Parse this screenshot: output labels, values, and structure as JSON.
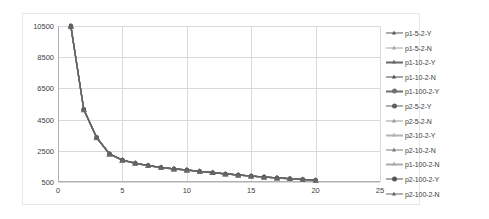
{
  "chart_data": {
    "type": "line",
    "title": "",
    "subtitle": "",
    "xlabel": "",
    "ylabel": "",
    "xlim": [
      0,
      25
    ],
    "ylim": [
      500,
      10500
    ],
    "grid": true,
    "legend_position": "right",
    "x_ticks": [
      "0",
      "5",
      "10",
      "15",
      "20",
      "25"
    ],
    "x_tick_values": [
      0,
      5,
      10,
      15,
      20,
      25
    ],
    "y_ticks": [
      "500",
      "2500",
      "4500",
      "6500",
      "8500",
      "10500"
    ],
    "y_tick_values": [
      500,
      2500,
      4500,
      6500,
      8500,
      10500
    ],
    "x": [
      1,
      2,
      3,
      4,
      5,
      6,
      7,
      8,
      9,
      10,
      11,
      12,
      13,
      14,
      15,
      16,
      17,
      18,
      19,
      20
    ],
    "series": [
      {
        "name": "p1-5-2-Y",
        "color": "#595959",
        "marker": "triangle",
        "values": [
          10500,
          5150,
          3350,
          2300,
          1900,
          1700,
          1550,
          1430,
          1340,
          1270,
          1180,
          1100,
          1020,
          950,
          880,
          820,
          760,
          710,
          660,
          610
        ]
      },
      {
        "name": "p1-5-2-N",
        "color": "#a6a6a6",
        "marker": "triangle",
        "values": [
          10450,
          5120,
          3330,
          2290,
          1890,
          1690,
          1540,
          1420,
          1330,
          1260,
          1170,
          1090,
          1015,
          945,
          875,
          815,
          755,
          705,
          655,
          605
        ]
      },
      {
        "name": "p1-10-2-Y",
        "color": "#6b6b6b",
        "marker": "triangle",
        "values": [
          10500,
          5170,
          3360,
          2310,
          1910,
          1710,
          1560,
          1440,
          1345,
          1275,
          1185,
          1105,
          1025,
          955,
          885,
          825,
          765,
          715,
          665,
          615
        ]
      },
      {
        "name": "p1-10-2-N",
        "color": "#4d4d4d",
        "marker": "triangle",
        "values": [
          10480,
          5140,
          3340,
          2295,
          1895,
          1695,
          1545,
          1425,
          1335,
          1265,
          1175,
          1095,
          1018,
          948,
          878,
          818,
          758,
          708,
          658,
          608
        ]
      },
      {
        "name": "p1-100-2-Y",
        "color": "#707070",
        "marker": "circle",
        "values": [
          10500,
          5160,
          3355,
          2305,
          1905,
          1705,
          1555,
          1435,
          1342,
          1272,
          1182,
          1102,
          1022,
          952,
          882,
          822,
          762,
          712,
          662,
          612
        ]
      },
      {
        "name": "p2-5-2-Y",
        "color": "#5e5e5e",
        "marker": "circle",
        "values": [
          10460,
          5130,
          3335,
          2292,
          1892,
          1692,
          1542,
          1422,
          1332,
          1262,
          1172,
          1092,
          1016,
          946,
          876,
          816,
          756,
          706,
          656,
          606
        ]
      },
      {
        "name": "p2-5-2-N",
        "color": "#9a9a9a",
        "marker": "triangle",
        "values": [
          10440,
          5110,
          3325,
          2288,
          1888,
          1688,
          1538,
          1418,
          1328,
          1258,
          1168,
          1088,
          1012,
          942,
          872,
          812,
          752,
          702,
          652,
          602
        ]
      },
      {
        "name": "p2-10-2-Y",
        "color": "#b3b3b3",
        "marker": "triangle",
        "values": [
          10470,
          5145,
          3342,
          2298,
          1898,
          1698,
          1548,
          1428,
          1338,
          1268,
          1178,
          1098,
          1019,
          949,
          879,
          819,
          759,
          709,
          659,
          609
        ]
      },
      {
        "name": "p2-10-2-N",
        "color": "#7d7d7d",
        "marker": "triangle",
        "values": [
          10490,
          5155,
          3348,
          2302,
          1902,
          1702,
          1552,
          1432,
          1341,
          1271,
          1181,
          1101,
          1021,
          951,
          881,
          821,
          761,
          711,
          661,
          611
        ]
      },
      {
        "name": "p1-100-2-N",
        "color": "#acacac",
        "marker": "triangle",
        "values": [
          10455,
          5125,
          3332,
          2291,
          1891,
          1691,
          1541,
          1421,
          1331,
          1261,
          1171,
          1091,
          1014,
          944,
          874,
          814,
          754,
          704,
          654,
          604
        ]
      },
      {
        "name": "p2-100-2-Y",
        "color": "#555555",
        "marker": "circle",
        "values": [
          10500,
          5165,
          3358,
          2308,
          1908,
          1708,
          1558,
          1438,
          1344,
          1274,
          1184,
          1104,
          1024,
          954,
          884,
          824,
          764,
          714,
          664,
          614
        ]
      },
      {
        "name": "p2-100-2-N",
        "color": "#656565",
        "marker": "triangle",
        "values": [
          10475,
          5148,
          3345,
          2300,
          1900,
          1700,
          1550,
          1430,
          1340,
          1270,
          1180,
          1100,
          1020,
          950,
          880,
          820,
          760,
          710,
          660,
          610
        ]
      }
    ]
  }
}
